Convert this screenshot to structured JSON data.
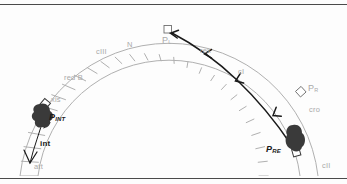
{
  "figure": {
    "title_visible": false,
    "background_color": "#fdfdfd",
    "rules": {
      "top_rule_color": "#4a4a4a",
      "bottom_rule_color": "#4a4a4a"
    },
    "ring": {
      "description": "semicircular-genome-arc",
      "segment_count": 28,
      "stroke_color": "#b0b0b0"
    },
    "transcript_curve": {
      "color": "#1a1a1a",
      "direction": "leftward-counterclockwise",
      "arrowhead_count": 5
    }
  },
  "gene_labels": [
    {
      "id": "att",
      "text": "att"
    },
    {
      "id": "int",
      "text": "int"
    },
    {
      "id": "xis",
      "text": "xis"
    },
    {
      "id": "redB",
      "text": "red B"
    },
    {
      "id": "cIII",
      "text": "cIII"
    },
    {
      "id": "N",
      "text": "N"
    },
    {
      "id": "rex",
      "text": "rex"
    },
    {
      "id": "cI",
      "text": "cI"
    },
    {
      "id": "cro",
      "text": "cro"
    },
    {
      "id": "cII",
      "text": "cII"
    }
  ],
  "promoters": [
    {
      "id": "PL",
      "name": "P",
      "subscript": "L",
      "style": "gray"
    },
    {
      "id": "PR",
      "name": "P",
      "subscript": "R",
      "style": "gray"
    },
    {
      "id": "PINT",
      "name": "P",
      "subscript": "INT",
      "style": "bold-dark"
    },
    {
      "id": "PRE",
      "name": "P",
      "subscript": "RE",
      "style": "bold-dark"
    }
  ],
  "proteins": [
    {
      "id": "blob-int",
      "shape": "dark-irregular-blob",
      "color": "#3a3a3a",
      "at": "PINT"
    },
    {
      "id": "blob-re",
      "shape": "dark-irregular-blob",
      "color": "#3a3a3a",
      "at": "PRE"
    }
  ],
  "arrows": {
    "int_arrow_label": "int"
  }
}
